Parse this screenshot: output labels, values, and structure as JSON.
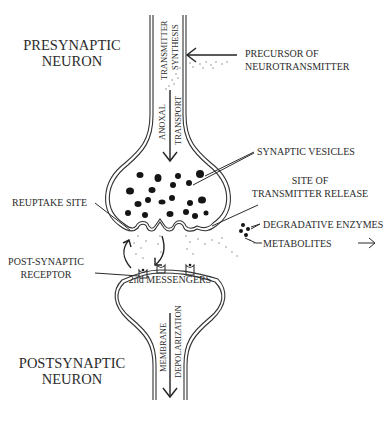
{
  "diagram": {
    "title": "",
    "regions": {
      "presynaptic": {
        "line1": "PRESYNAPTIC",
        "line2": "NEURON"
      },
      "postsynaptic": {
        "line1": "POSTSYNAPTIC",
        "line2": "NEURON"
      }
    },
    "axon_labels": {
      "synthesis_line1": "TRANSMITTER",
      "synthesis_line2": "SYNTHESIS",
      "transport_line1": "ANOXAL",
      "transport_line2": "TRANSPORT",
      "depol_line1": "MEMBRANE",
      "depol_line2": "DEPOLARIZATION"
    },
    "callouts": {
      "precursor_line1": "PRECURSOR OF",
      "precursor_line2": "NEUROTRANSMITTER",
      "vesicles": "SYNAPTIC VESICLES",
      "release_line1": "SITE OF",
      "release_line2": "TRANSMITTER RELEASE",
      "reuptake": "REUPTAKE SITE",
      "enzymes": "DEGRADATIVE ENZYMES",
      "metabolites": "METABOLITES",
      "receptor_line1": "POST-SYNAPTIC",
      "receptor_line2": "RECEPTOR",
      "messengers": "2nd MESSENGERS"
    },
    "colors": {
      "ink": "#2b2b2b",
      "vesicle": "#151515",
      "background": "#ffffff"
    }
  }
}
